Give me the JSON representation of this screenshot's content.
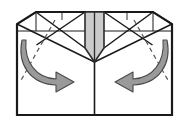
{
  "figure": {
    "type": "instructional-fold-diagram",
    "step_label": ""
  },
  "canvas": {
    "width": 190,
    "height": 122,
    "background": "#ffffff"
  },
  "colors": {
    "outline": "#1a1a1a",
    "crease_solid": "#1a1a1a",
    "crease_dashed": "#555555",
    "flap_fill": "#cbcbcb",
    "flap_edge": "#2b2b2b",
    "arrow_fill": "#9a9a9a",
    "arrow_stroke": "#4a4a4a",
    "paper_fill": "#ffffff"
  },
  "geometry": {
    "sheet": {
      "left_x": 17,
      "right_x": 172,
      "top_y": 12,
      "bottom_y": 115,
      "chamfer_x_left": 36,
      "chamfer_x_right": 153,
      "chamfer_y": 24,
      "horizontal_crease_y": 31,
      "center_x": 94.5,
      "flap_point_y": 62
    },
    "flap": {
      "left_x": 85,
      "right_x": 104,
      "top_y": 12,
      "taper_start_y": 48,
      "point_y": 62,
      "mid_line_x": 94.5
    }
  },
  "elements": {
    "sheet_outline_name": "paper-sheet-outline",
    "center_flap_name": "center-gray-flap",
    "left_arrow_name": "left-fold-arrow",
    "right_arrow_name": "right-fold-arrow",
    "center_fold_line_name": "center-vertical-fold-line",
    "horizontal_crease_name": "horizontal-crease-line",
    "left_x_crease_name": "left-panel-x-crease",
    "right_x_crease_name": "right-panel-x-crease",
    "left_dashed_crease_name": "left-dashed-crease",
    "right_dashed_crease_name": "right-dashed-crease"
  },
  "labels": {
    "left_arrow_action": "fold right",
    "right_arrow_action": "fold left",
    "center_flap_role": "raised center flap",
    "caption": ""
  }
}
